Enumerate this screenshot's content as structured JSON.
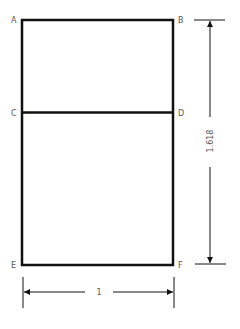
{
  "diagram": {
    "points": {
      "A": "A",
      "B": "B",
      "C": "C",
      "D": "D",
      "E": "E",
      "F": "F"
    },
    "dimensions": {
      "height_label": "1.618",
      "width_label": "1"
    },
    "colors": {
      "line": "#111111",
      "text": "#555555",
      "background": "#ffffff"
    }
  }
}
